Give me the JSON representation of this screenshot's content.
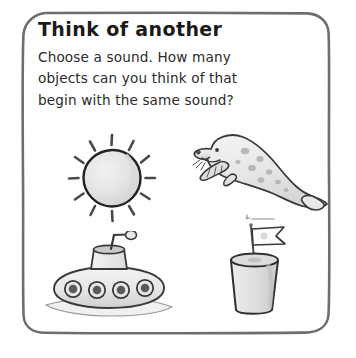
{
  "card": {
    "title": "Think of another",
    "body_lines": [
      "Choose a sound. How many",
      "objects can you think of that",
      "begin with the same sound?"
    ]
  },
  "illustrations": [
    {
      "id": "sun",
      "name": "sun-illustration",
      "label": "sun"
    },
    {
      "id": "seal",
      "name": "seal-illustration",
      "label": "seal"
    },
    {
      "id": "sub",
      "name": "submarine-illustration",
      "label": "submarine"
    },
    {
      "id": "castle",
      "name": "sandcastle-illustration",
      "label": "sandcastle"
    }
  ],
  "colors": {
    "background": "#ffffff",
    "frame_stroke": "#6e6e6e",
    "title_text": "#1a1a1a",
    "body_text": "#2a2a2a",
    "ink": "#3a3a3a",
    "fill_light": "#ececec",
    "fill_mid": "#dcdcdc",
    "fill_shade": "#cfcfcf"
  }
}
